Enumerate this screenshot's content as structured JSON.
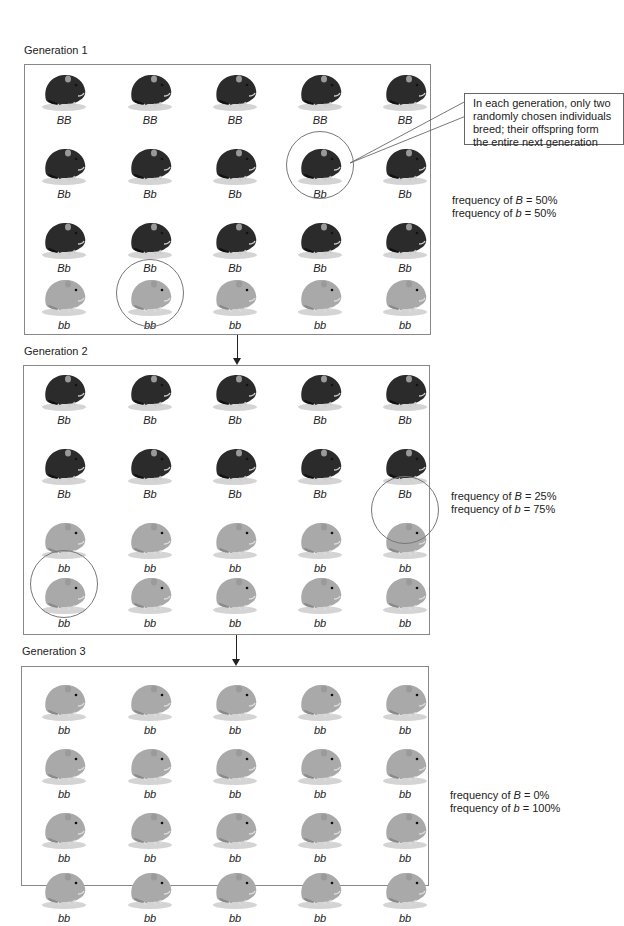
{
  "generations": [
    {
      "label": "Generation 1",
      "freq_B_prefix": "frequency of ",
      "freq_B_allele": "B",
      "freq_B_value": " = 50%",
      "freq_b_prefix": "frequency of ",
      "freq_b_allele": "b",
      "freq_b_value": " = 50%",
      "rows": [
        [
          "BB",
          "BB",
          "BB",
          "BB",
          "BB"
        ],
        [
          "Bb",
          "Bb",
          "Bb",
          "Bb",
          "Bb"
        ],
        [
          "Bb",
          "Bb",
          "Bb",
          "Bb",
          "Bb"
        ],
        [
          "bb",
          "bb",
          "bb",
          "bb",
          "bb"
        ]
      ],
      "circled": [
        [
          1,
          3
        ],
        [
          3,
          1
        ]
      ]
    },
    {
      "label": "Generation 2",
      "freq_B_prefix": "frequency of ",
      "freq_B_allele": "B",
      "freq_B_value": " = 25%",
      "freq_b_prefix": "frequency of ",
      "freq_b_allele": "b",
      "freq_b_value": " = 75%",
      "rows": [
        [
          "Bb",
          "Bb",
          "Bb",
          "Bb",
          "Bb"
        ],
        [
          "Bb",
          "Bb",
          "Bb",
          "Bb",
          "Bb"
        ],
        [
          "bb",
          "bb",
          "bb",
          "bb",
          "bb"
        ],
        [
          "bb",
          "bb",
          "bb",
          "bb",
          "bb"
        ]
      ],
      "circled": [
        [
          2,
          4
        ],
        [
          3,
          0
        ]
      ]
    },
    {
      "label": "Generation 3",
      "freq_B_prefix": "frequency of ",
      "freq_B_allele": "B",
      "freq_B_value": " = 0%",
      "freq_b_prefix": "frequency of ",
      "freq_b_allele": "b",
      "freq_b_value": " = 100%",
      "rows": [
        [
          "bb",
          "bb",
          "bb",
          "bb",
          "bb"
        ],
        [
          "bb",
          "bb",
          "bb",
          "bb",
          "bb"
        ],
        [
          "bb",
          "bb",
          "bb",
          "bb",
          "bb"
        ],
        [
          "bb",
          "bb",
          "bb",
          "bb",
          "bb"
        ]
      ],
      "circled": []
    }
  ],
  "callout": {
    "line1": "In each generation, only two",
    "line2": "randomly chosen individuals",
    "line3": "breed; their offspring form",
    "line4": "the entire next generation"
  },
  "colors": {
    "dark_hamster": "#2b2b2b",
    "light_hamster": "#a9a9a9",
    "border": "#888888"
  }
}
